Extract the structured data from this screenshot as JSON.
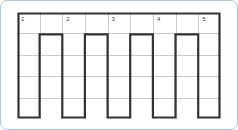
{
  "page": {
    "frame_color": "#a8c9e4",
    "background_color": "#ffffff",
    "grid_line_color": "#c9c9c9",
    "outline_color": "#333333"
  },
  "grid": {
    "columns": 9,
    "rows": 5,
    "cell_width": 22.6,
    "cell_height": 21.4,
    "numbered_cells": [
      {
        "number": "1",
        "column": 1,
        "row": 1
      },
      {
        "number": "2",
        "column": 3,
        "row": 1
      },
      {
        "number": "3",
        "column": 5,
        "row": 1
      },
      {
        "number": "4",
        "column": 7,
        "row": 1
      },
      {
        "number": "5",
        "column": 9,
        "row": 1
      }
    ],
    "comb": {
      "description": "Thick outline: full-width top row with five one-column-wide prongs descending from odd columns",
      "prong_columns": [
        1,
        3,
        5,
        7,
        9
      ],
      "header_rows": 1,
      "prong_rows": 4
    }
  }
}
